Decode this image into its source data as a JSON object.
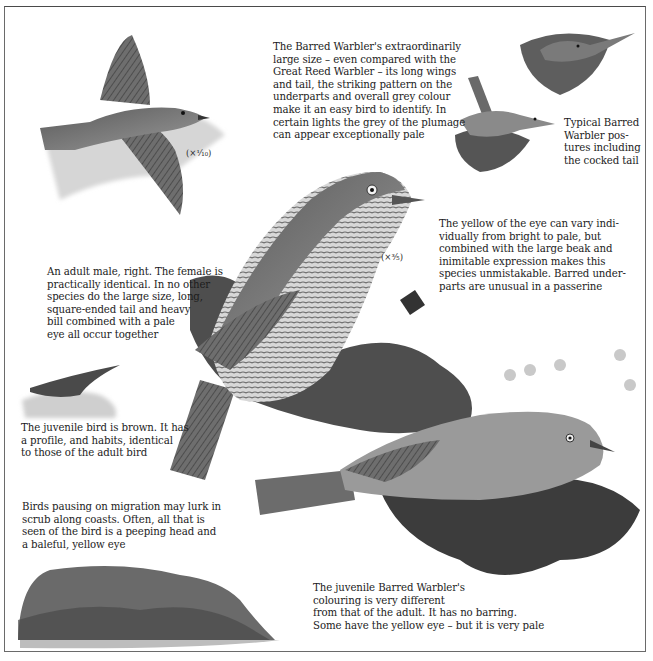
{
  "page": {
    "style": "monochrome field-guide illustration plate",
    "colors": {
      "paper": "#ffffff",
      "ink": "#1c1c1c",
      "frame": "#6a6a6a",
      "bird_dark": "#3a3a3a",
      "bird_mid": "#7a7a7a",
      "bird_light": "#c8c8c8",
      "foliage": "#5a5a5a"
    }
  },
  "captions": {
    "intro": "The Barred Warbler's extraordinarily\nlarge size – even compared with the\nGreat Reed Warbler – its long wings\nand tail, the striking pattern on the\nunderparts and overall grey colour\nmake it an easy bird to identify. In\ncertain lights the grey of the plumage\ncan appear exceptionally pale",
    "postures": "Typical Barred\nWarbler pos-\ntures including\nthe cocked tail",
    "eye": "The yellow of the eye can vary indi-\nvidually from bright to pale, but\ncombined with the large beak and\ninimitable expression makes this\nspecies unmistakable. Barred under-\nparts are unusual in a passerine",
    "adult_male": "An adult male, right. The female is\npractically identical. In no other\nspecies do the large size, long,\nsquare-ended tail and heavy\nbill combined with a pale\neye all occur together",
    "juvenile_flight": "The juvenile bird is brown. It has\na profile, and habits, identical\nto those of the adult bird",
    "migration": "Birds pausing on migration may lurk in\nscrub along coasts. Often, all that is\nseen of the bird is a peeping head and\na baleful, yellow eye",
    "juvenile": "The juvenile Barred Warbler's\ncolouring is very different\nfrom that of the adult. It has no barring.\nSome have the yellow eye – but it is very pale"
  },
  "scale_labels": {
    "main": "(×³⁄₅)",
    "flight": "(×¹⁄₁₀)"
  },
  "illustrations": [
    {
      "id": "flying-adult",
      "label": "Barred Warbler in flight"
    },
    {
      "id": "posture-top",
      "label": "Warbler perched on leaves"
    },
    {
      "id": "posture-cocked-tail",
      "label": "Warbler with cocked tail"
    },
    {
      "id": "adult-male",
      "label": "Adult male Barred Warbler"
    },
    {
      "id": "juvenile-flight",
      "label": "Juvenile in flight over scrub"
    },
    {
      "id": "juvenile-perched",
      "label": "Juvenile Barred Warbler"
    },
    {
      "id": "scrub",
      "label": "Coastal scrub with lurking warblers"
    }
  ]
}
